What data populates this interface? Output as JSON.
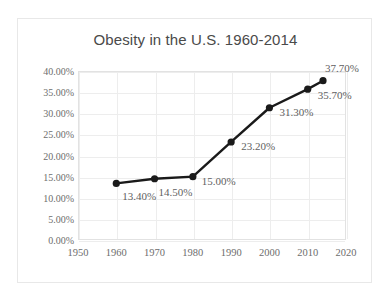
{
  "chart_data": {
    "type": "line",
    "title": "Obesity in the U.S. 1960-2014",
    "xlabel": "",
    "ylabel": "",
    "x": [
      1960,
      1970,
      1980,
      1990,
      2000,
      2010,
      2014
    ],
    "values": [
      13.4,
      14.5,
      15.0,
      23.2,
      31.3,
      35.7,
      37.7
    ],
    "point_labels": [
      "13.40%",
      "14.50%",
      "15.00%",
      "23.20%",
      "31.30%",
      "35.70%",
      "37.70%"
    ],
    "xlim": [
      1950,
      2020
    ],
    "ylim": [
      0,
      40
    ],
    "xticks": [
      1950,
      1960,
      1970,
      1980,
      1990,
      2000,
      2010,
      2020
    ],
    "xtick_labels": [
      "1950",
      "1960",
      "1970",
      "1980",
      "1990",
      "2000",
      "2010",
      "2020"
    ],
    "yticks": [
      0,
      5,
      10,
      15,
      20,
      25,
      30,
      35,
      40
    ],
    "ytick_labels": [
      "0.00%",
      "5.00%",
      "10.00%",
      "15.00%",
      "20.00%",
      "25.00%",
      "30.00%",
      "35.00%",
      "40.00%"
    ],
    "grid": true,
    "legend": false,
    "series_color": "#1a1a1a",
    "marker": "circle",
    "marker_color": "#1a1a1a",
    "gridline_color": "#ededed",
    "label_color": "#5f5f5f",
    "title_color": "#4a4a4a",
    "background": "#ffffff",
    "label_offsets": [
      {
        "dx": 6,
        "dy": 13
      },
      {
        "dx": 4,
        "dy": 13
      },
      {
        "dx": 9,
        "dy": 4
      },
      {
        "dx": 10,
        "dy": 4
      },
      {
        "dx": 10,
        "dy": 4
      },
      {
        "dx": 10,
        "dy": 6
      },
      {
        "dx": 2,
        "dy": -13
      }
    ]
  }
}
